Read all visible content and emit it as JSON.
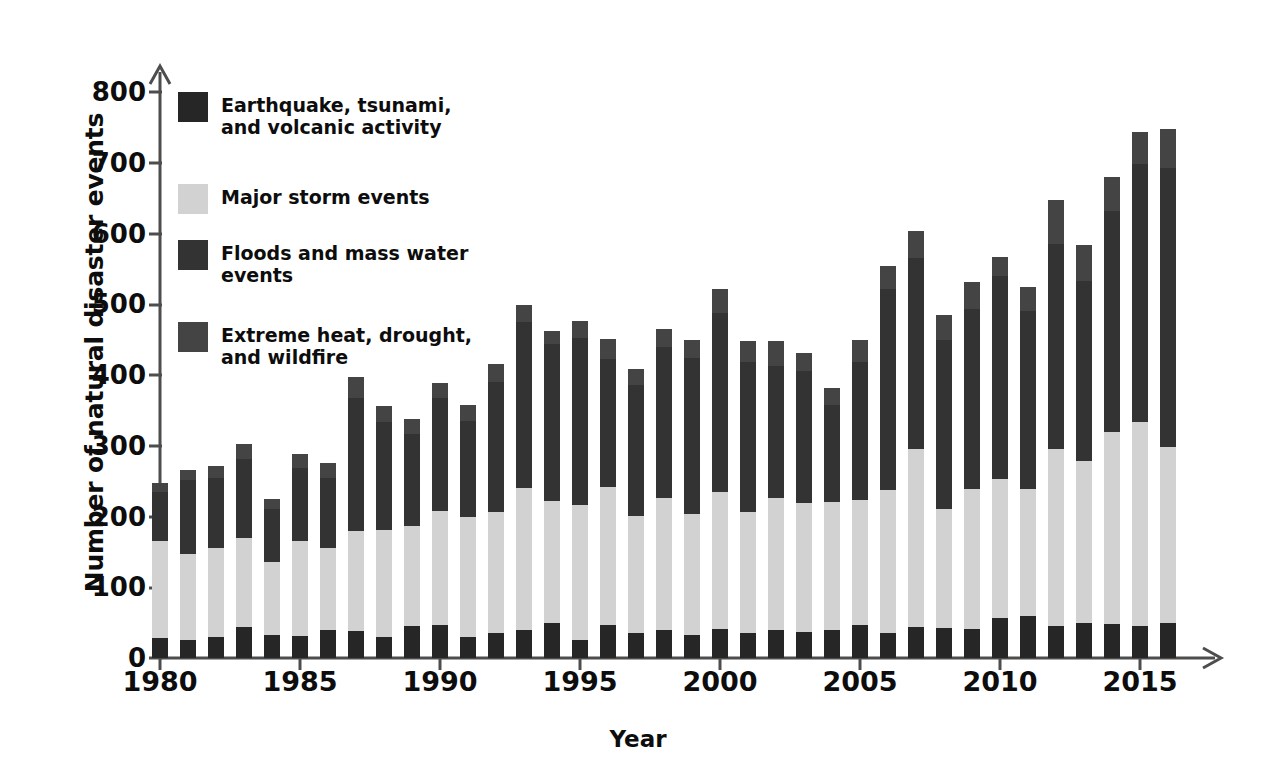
{
  "chart_data": {
    "type": "bar",
    "subtype": "stacked-bar",
    "title": "",
    "xlabel": "Year",
    "ylabel": "Number of natural disaster events",
    "ylim": [
      0,
      800
    ],
    "ytick_step": 100,
    "yticks": [
      0,
      100,
      200,
      300,
      400,
      500,
      600,
      700,
      800
    ],
    "xlim": [
      1979.4,
      2016.8
    ],
    "xticks": [
      1980,
      1985,
      1990,
      1995,
      2000,
      2005,
      2010,
      2015
    ],
    "grid": false,
    "legend_position": "upper-left-inside",
    "stack_order_bottom_to_top": [
      "Earthquake, tsunami, and volcanic activity",
      "Major storm events",
      "Floods and mass water events",
      "Extreme heat, drought, and wildfire"
    ],
    "categories": [
      1980,
      1981,
      1982,
      1983,
      1984,
      1985,
      1986,
      1987,
      1988,
      1989,
      1990,
      1991,
      1992,
      1993,
      1994,
      1995,
      1996,
      1997,
      1998,
      1999,
      2000,
      2001,
      2002,
      2003,
      2004,
      2005,
      2006,
      2007,
      2008,
      2009,
      2010,
      2011,
      2012,
      2013,
      2014,
      2015,
      2016
    ],
    "series": [
      {
        "name": "Earthquake, tsunami, and volcanic activity",
        "color": "#262626",
        "values": [
          28,
          25,
          29,
          44,
          33,
          31,
          40,
          38,
          30,
          45,
          47,
          30,
          35,
          40,
          49,
          25,
          46,
          35,
          40,
          32,
          41,
          36,
          40,
          37,
          39,
          46,
          35,
          44,
          43,
          41,
          57,
          59,
          45,
          50,
          48,
          45,
          50
        ]
      },
      {
        "name": "Major storm events",
        "color": "#d2d2d2",
        "values": [
          138,
          122,
          127,
          126,
          103,
          134,
          115,
          141,
          151,
          142,
          161,
          170,
          172,
          200,
          173,
          191,
          196,
          166,
          186,
          171,
          193,
          171,
          186,
          182,
          181,
          178,
          202,
          251,
          168,
          198,
          196,
          180,
          250,
          228,
          272,
          288,
          248
        ]
      },
      {
        "name": "Floods and mass water events",
        "color": "#333333",
        "values": [
          68,
          104,
          99,
          112,
          75,
          104,
          99,
          189,
          153,
          130,
          160,
          135,
          183,
          235,
          222,
          236,
          180,
          185,
          214,
          221,
          253,
          211,
          187,
          187,
          138,
          194,
          285,
          271,
          239,
          254,
          287,
          251,
          290,
          255,
          312,
          365,
          395
        ]
      },
      {
        "name": "Extreme heat, drought, and wildfire",
        "color": "#444444",
        "values": [
          14,
          15,
          17,
          20,
          14,
          20,
          21,
          29,
          22,
          21,
          21,
          23,
          25,
          24,
          18,
          24,
          29,
          22,
          25,
          26,
          35,
          30,
          35,
          25,
          24,
          32,
          32,
          37,
          35,
          38,
          27,
          35,
          62,
          51,
          48,
          46,
          55
        ]
      }
    ],
    "totals": [
      248,
      266,
      272,
      302,
      225,
      289,
      275,
      397,
      356,
      338,
      389,
      358,
      415,
      499,
      462,
      476,
      451,
      408,
      465,
      450,
      522,
      448,
      448,
      431,
      382,
      450,
      554,
      603,
      485,
      531,
      567,
      525,
      647,
      584,
      680,
      744,
      748
    ]
  },
  "axes": {
    "y_title": "Number of natural disaster events",
    "x_title": "Year",
    "y_tick_labels": [
      "800",
      "700",
      "600",
      "500",
      "400",
      "300",
      "200",
      "100",
      "0"
    ],
    "x_tick_labels": [
      "1980",
      "1985",
      "1990",
      "1995",
      "2000",
      "2005",
      "2010",
      "2015"
    ]
  },
  "legend": {
    "items": [
      {
        "label": "Earthquake, tsunami,\nand volcanic activity",
        "swatch_name": "legend-swatch-earthquake",
        "color": "#262626"
      },
      {
        "label": "Major storm events",
        "swatch_name": "legend-swatch-storm",
        "color": "#d2d2d2"
      },
      {
        "label": "Floods and mass water\nevents",
        "swatch_name": "legend-swatch-floods",
        "color": "#333333"
      },
      {
        "label": "Extreme heat, drought,\nand wildfire",
        "swatch_name": "legend-swatch-heat",
        "color": "#444444"
      }
    ]
  },
  "style": {
    "axis_color": "#4d4d4d",
    "text_color": "#0d0d0d",
    "background": "#ffffff"
  }
}
